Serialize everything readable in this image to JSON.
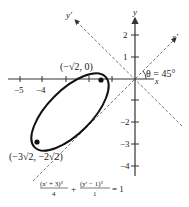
{
  "figure": {
    "axes": {
      "x_label": "x",
      "y_label": "y",
      "x_prime_label": "x′",
      "y_prime_label": "y′",
      "x_ticks": [
        {
          "value": -5,
          "label": "−5"
        },
        {
          "value": -4,
          "label": "−4"
        },
        {
          "value": -3,
          "label": ""
        },
        {
          "value": -2,
          "label": ""
        },
        {
          "value": -1,
          "label": ""
        }
      ],
      "y_ticks": [
        {
          "value": 2,
          "label": "2"
        },
        {
          "value": 1,
          "label": "1"
        },
        {
          "value": -1,
          "label": ""
        },
        {
          "value": -2,
          "label": "−2"
        },
        {
          "value": -3,
          "label": "−3"
        },
        {
          "value": -4,
          "label": "−4"
        }
      ]
    },
    "angle_label": "θ = 45°",
    "points": [
      {
        "label": "(−√2, 0)",
        "x": -1.414,
        "y": 0
      },
      {
        "label": "(−3√2, −2√2)",
        "x": -4.243,
        "y": -2.828
      }
    ],
    "equation": {
      "term1_num": "(x′ + 3)²",
      "term1_den": "4",
      "plus": "+",
      "term2_num": "(y′ − 1)²",
      "term2_den": "1",
      "rhs": "= 1"
    },
    "labels": {
      "point_top": "(−√2, 0)",
      "point_bottom": "(−3√2, −2√2)",
      "y_tick_2": "2",
      "y_tick_1": "1",
      "y_tick_m2": "−2",
      "y_tick_m3": "−3",
      "y_tick_m4": "−4",
      "x_tick_m5": "−5",
      "x_tick_m4": "−4"
    }
  }
}
